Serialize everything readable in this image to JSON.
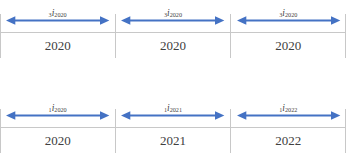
{
  "colors": {
    "arrow_blue": "#4472C4",
    "axis_gray": "#c8c8c8",
    "text_gray": "#404040"
  },
  "timelines": [
    {
      "name": "three-year-rate-timeline",
      "segments": [
        {
          "pre": "3",
          "base": "i",
          "sub": "2020",
          "year": "2020"
        },
        {
          "pre": "3",
          "base": "i",
          "sub": "2020",
          "year": "2020"
        },
        {
          "pre": "3",
          "base": "i",
          "sub": "2020",
          "year": "2020"
        }
      ]
    },
    {
      "name": "one-year-rate-timeline",
      "segments": [
        {
          "pre": "1",
          "base": "i",
          "sub": "2020",
          "year": "2020"
        },
        {
          "pre": "1",
          "base": "i",
          "sub": "2021",
          "year": "2021"
        },
        {
          "pre": "1",
          "base": "i",
          "sub": "2022",
          "year": "2022"
        }
      ]
    }
  ]
}
